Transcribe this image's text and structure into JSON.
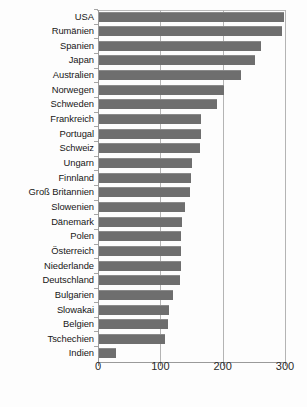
{
  "chart_data": {
    "type": "bar",
    "orientation": "horizontal",
    "title": "",
    "subtitle": "",
    "xlabel": "",
    "ylabel": "",
    "xlim": [
      0,
      300
    ],
    "xticks": [
      0,
      100,
      200,
      300
    ],
    "xtick_labels": [
      "0",
      "100",
      "200",
      "300"
    ],
    "grid": true,
    "grid_axis": "x",
    "legend": false,
    "legend_position": "none",
    "bar_color": "#6e6e6e",
    "background_color": "#fdfdfd",
    "categories": [
      "USA",
      "Rumänien",
      "Spanien",
      "Japan",
      "Australien",
      "Norwegen",
      "Schweden",
      "Frankreich",
      "Portugal",
      "Schweiz",
      "Ungarn",
      "Finnland",
      "Groß Britannien",
      "Slowenien",
      "Dänemark",
      "Polen",
      "Österreich",
      "Niederlande",
      "Deutschland",
      "Bulgarien",
      "Slowakai",
      "Belgien",
      "Tschechien",
      "Indien"
    ],
    "values": [
      296,
      294,
      260,
      250,
      228,
      200,
      190,
      163,
      163,
      162,
      149,
      148,
      146,
      138,
      133,
      132,
      132,
      132,
      130,
      118,
      113,
      110,
      106,
      28
    ]
  }
}
